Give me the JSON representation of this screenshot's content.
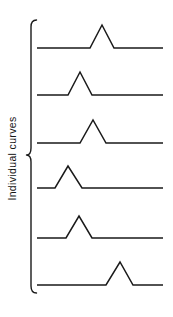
{
  "figure": {
    "background_color": "#ffffff",
    "stroke_color": "#1a1a1a",
    "width": 173,
    "height": 317,
    "group_label": "Individual curves",
    "brace_name": "left-curly-brace"
  },
  "chart_data": {
    "type": "line",
    "title": "",
    "subtitle": "",
    "xlabel": "",
    "ylabel": "Individual curves",
    "grid": false,
    "legend": null,
    "axes_visible": false,
    "tick_labels_x": [],
    "tick_labels_y": [],
    "annotations": [
      {
        "text": "Individual curves",
        "orientation": "vertical-90ccw",
        "position": "left-margin",
        "brace": "spans all six curves"
      }
    ],
    "xlim": [
      37,
      163
    ],
    "series": [
      {
        "name": "curve-1",
        "baseline_y": 48,
        "peak_center_x": 102,
        "peak_start_x": 90,
        "peak_end_x": 114,
        "peak_height": 23,
        "x": [
          37,
          90,
          102,
          114,
          163
        ],
        "y": [
          0,
          0,
          23,
          0,
          0
        ]
      },
      {
        "name": "curve-2",
        "baseline_y": 95,
        "peak_center_x": 80,
        "peak_start_x": 68,
        "peak_end_x": 92,
        "peak_height": 23,
        "x": [
          37,
          68,
          80,
          92,
          163
        ],
        "y": [
          0,
          0,
          23,
          0,
          0
        ]
      },
      {
        "name": "curve-3",
        "baseline_y": 143,
        "peak_center_x": 93,
        "peak_start_x": 80,
        "peak_end_x": 106,
        "peak_height": 23,
        "x": [
          37,
          80,
          93,
          106,
          163
        ],
        "y": [
          0,
          0,
          23,
          0,
          0
        ]
      },
      {
        "name": "curve-4",
        "baseline_y": 188,
        "peak_center_x": 68,
        "peak_start_x": 55,
        "peak_end_x": 82,
        "peak_height": 22,
        "x": [
          37,
          55,
          68,
          82,
          163
        ],
        "y": [
          0,
          0,
          22,
          0,
          0
        ]
      },
      {
        "name": "curve-5",
        "baseline_y": 238,
        "peak_center_x": 79,
        "peak_start_x": 66,
        "peak_end_x": 92,
        "peak_height": 22,
        "x": [
          37,
          66,
          79,
          92,
          163
        ],
        "y": [
          0,
          0,
          22,
          0,
          0
        ]
      },
      {
        "name": "curve-6",
        "baseline_y": 285,
        "peak_center_x": 120,
        "peak_start_x": 106,
        "peak_end_x": 133,
        "peak_height": 23,
        "x": [
          37,
          106,
          120,
          133,
          163
        ],
        "y": [
          0,
          0,
          23,
          0,
          0
        ]
      }
    ],
    "brace": {
      "x_spine": 31,
      "x_tip": 26.5,
      "y_top": 20,
      "y_bottom": 293,
      "y_mid": 155
    }
  }
}
